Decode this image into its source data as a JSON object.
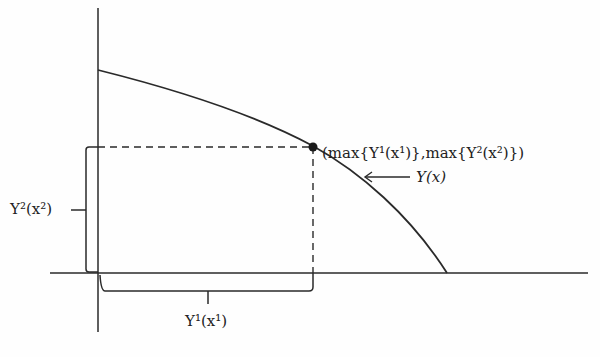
{
  "diagram": {
    "type": "production-possibility-frontier",
    "labels": {
      "point": "(max{Y¹(x¹)},max{Y²(x²)})",
      "curve": "Y(x)",
      "y_brace": "Y²(x²)",
      "x_brace": "Y¹(x¹)"
    },
    "colors": {
      "line": "#2a2a2a",
      "text": "#222222"
    }
  }
}
